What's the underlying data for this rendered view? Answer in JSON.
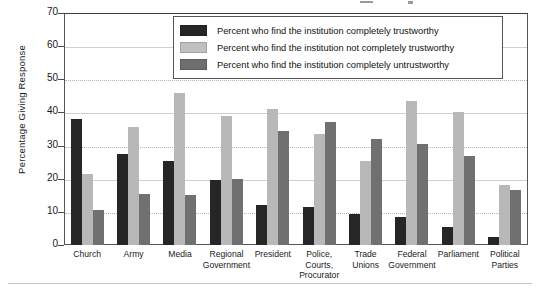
{
  "chart_data": {
    "type": "bar",
    "title": "",
    "xlabel": "",
    "ylabel": "Percentage Giving Response",
    "ylim": [
      0,
      70
    ],
    "yticks": [
      0,
      10,
      20,
      30,
      40,
      50,
      60,
      70
    ],
    "grid": true,
    "legend_position": "top-center",
    "categories": [
      "Church",
      "Army",
      "Media",
      "Regional Government",
      "President",
      "Police, Courts, Procurator",
      "Trade Unions",
      "Federal Government",
      "Parliament",
      "Political Parties"
    ],
    "category_lines": [
      [
        "Church"
      ],
      [
        "Army"
      ],
      [
        "Media"
      ],
      [
        "Regional",
        "Government"
      ],
      [
        "President"
      ],
      [
        "Police,",
        "Courts,",
        "Procurator"
      ],
      [
        "Trade",
        "Unions"
      ],
      [
        "Federal",
        "Government"
      ],
      [
        "Parliament"
      ],
      [
        "Political",
        "Parties"
      ]
    ],
    "series": [
      {
        "name": "Percent who find the institution completely trustworthy",
        "color": "#262626",
        "values": [
          38,
          27.5,
          25.5,
          19.5,
          12,
          11.5,
          9.5,
          8.5,
          5.5,
          2.5
        ]
      },
      {
        "name": "Percent who find the institution not completely trustworthy",
        "color": "#b8b8b8",
        "values": [
          21.5,
          35.5,
          46,
          39,
          41,
          33.5,
          25.5,
          43.5,
          40,
          18
        ]
      },
      {
        "name": "Percent who find the institution completely untrustworthy",
        "color": "#707070",
        "values": [
          10.5,
          15.5,
          15,
          20,
          34.5,
          37,
          32,
          30.5,
          27,
          16.5
        ]
      }
    ]
  },
  "legend": {
    "items": [
      {
        "label": "Percent who find the institution completely trustworthy",
        "swatch": "legend-swatch-dark"
      },
      {
        "label": "Percent who find the institution not completely trustworthy",
        "swatch": "legend-swatch-light"
      },
      {
        "label": "Percent who find the institution completely untrustworthy",
        "swatch": "legend-swatch-medium"
      }
    ]
  }
}
